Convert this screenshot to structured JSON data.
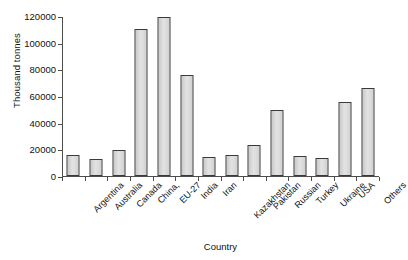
{
  "chart_data": {
    "type": "bar",
    "title": "",
    "xlabel": "Country",
    "ylabel": "Thousand tonnes",
    "ylim": [
      0,
      120000
    ],
    "ytick_labels": [
      "0",
      "20000",
      "40000",
      "60000",
      "80000",
      "100000",
      "120000"
    ],
    "ytick_values": [
      0,
      20000,
      40000,
      60000,
      80000,
      100000,
      120000
    ],
    "grid": false,
    "legend": "none",
    "categories": [
      "Argentina",
      "Australia",
      "Canada",
      "China,",
      "EU-27",
      "India",
      "Iran",
      "Kazakhstan",
      "Pakistan",
      "Russian",
      "Turkey",
      "Ukraine",
      "USA",
      "Others"
    ],
    "values": [
      16000,
      12500,
      19800,
      110000,
      119000,
      75500,
      14500,
      16000,
      23000,
      49500,
      15000,
      13500,
      55500,
      66000
    ],
    "bar_fill_color": "#dcdcdc",
    "bar_border_color": "#3a3a3a",
    "axis_color": "#4d4d4d",
    "background_color": "#ffffff"
  }
}
